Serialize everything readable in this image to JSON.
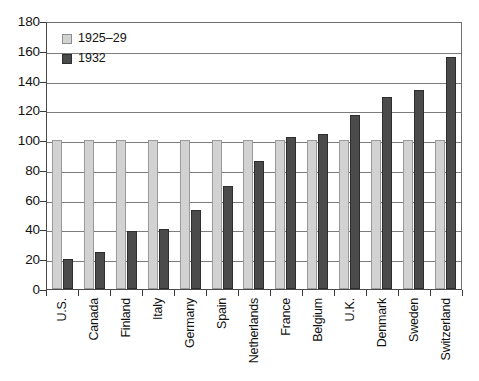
{
  "chart_data": {
    "type": "bar",
    "title": "",
    "xlabel": "",
    "ylabel": "",
    "ylim": [
      0,
      180
    ],
    "ytick_step": 20,
    "yticks": [
      180,
      160,
      140,
      120,
      100,
      80,
      60,
      40,
      20,
      0
    ],
    "grid": true,
    "legend_position": "upper-left-inside",
    "categories": [
      "U.S.",
      "Canada",
      "Finland",
      "Italy",
      "Germany",
      "Spain",
      "Netherlands",
      "France",
      "Belgium",
      "U.K.",
      "Denmark",
      "Sweden",
      "Switzerland"
    ],
    "series": [
      {
        "name": "1925–29",
        "color": "#d2d2d2",
        "values": [
          100,
          100,
          100,
          100,
          100,
          100,
          100,
          100,
          100,
          100,
          100,
          100,
          100
        ]
      },
      {
        "name": "1932",
        "color": "#4b4b4b",
        "values": [
          20,
          25,
          39,
          40,
          53,
          69,
          86,
          102,
          104,
          117,
          129,
          134,
          156
        ]
      }
    ]
  },
  "legend": {
    "items": [
      {
        "label": "1925–29",
        "swatch": "light"
      },
      {
        "label": "1932",
        "swatch": "dark"
      }
    ]
  },
  "caption": {
    "text": ""
  }
}
